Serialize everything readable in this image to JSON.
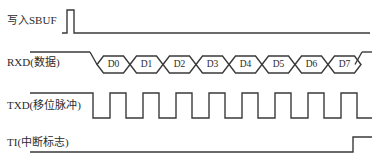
{
  "diagram": {
    "line_color": "#3a3a3a",
    "text_color": "#2b2b2b",
    "background": "#ffffff",
    "signals": [
      {
        "key": "write_sbuf",
        "label": "写入SBUF",
        "kind": "pulse",
        "idle_level": "low",
        "pulse_start_x": 67,
        "pulse_end_x": 74,
        "high_y": 10,
        "low_y": 33,
        "x_start": 62,
        "x_end": 370
      },
      {
        "key": "rxd_data",
        "label": "RXD(数据)",
        "kind": "data-bus",
        "idle_level": "high",
        "high_y": 52,
        "low_y": 76,
        "x_start": 30,
        "x_end": 372,
        "bus_start_x": 90,
        "bus_end_x": 355,
        "cell_width": 33,
        "transition_width": 7,
        "bits": [
          "D0",
          "D1",
          "D2",
          "D3",
          "D4",
          "D5",
          "D6",
          "D7"
        ]
      },
      {
        "key": "txd_clock",
        "label": "TXD(移位脉冲)",
        "kind": "clock",
        "idle_level": "high",
        "high_y": 93,
        "low_y": 118,
        "x_start": 30,
        "x_end": 372,
        "first_fall_x": 93,
        "pulse_count": 8,
        "period": 33,
        "high_width": 16
      },
      {
        "key": "ti_flag",
        "label": "TI(中断标志)",
        "kind": "step",
        "idle_level": "low",
        "high_y": 137,
        "low_y": 152,
        "x_start": 30,
        "x_end": 372,
        "rise_x": 353
      }
    ]
  }
}
